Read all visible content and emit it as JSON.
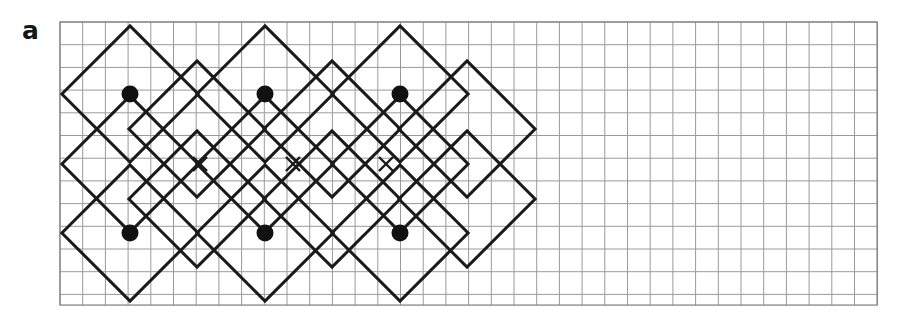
{
  "figure": {
    "panel_label": "a",
    "caption": "",
    "background_color": "#ffffff"
  },
  "colors": {
    "grid_line": "#9a9a9a",
    "grid_border": "#7d7d7d",
    "lattice_line": "#1a1a1a",
    "marker_dot": "#111111",
    "marker_cross": "#1a1a1a",
    "label_text": "#161616"
  },
  "grid": {
    "x0": 60,
    "y0": 22,
    "cell": 22.7,
    "cols": 36,
    "rows": 12.47,
    "line_width": 1,
    "border_width": 1.2
  },
  "lattice": {
    "line_width": 3,
    "half_diagonal_cells": 3,
    "diamonds": [
      {
        "cx": 130,
        "cy": 94
      },
      {
        "cx": 265,
        "cy": 94
      },
      {
        "cx": 400,
        "cy": 94
      },
      {
        "cx": 130,
        "cy": 164
      },
      {
        "cx": 265,
        "cy": 164
      },
      {
        "cx": 400,
        "cy": 164
      },
      {
        "cx": 130,
        "cy": 233
      },
      {
        "cx": 265,
        "cy": 233
      },
      {
        "cx": 400,
        "cy": 233
      },
      {
        "cx": 197,
        "cy": 129
      },
      {
        "cx": 332,
        "cy": 129
      },
      {
        "cx": 467,
        "cy": 129
      },
      {
        "cx": 197,
        "cy": 199
      },
      {
        "cx": 332,
        "cy": 199
      },
      {
        "cx": 467,
        "cy": 199
      }
    ]
  },
  "markers": {
    "dot_radius": 8.5,
    "cross_arm": 7,
    "cross_width": 2.4,
    "dots": [
      {
        "x": 130,
        "y": 94,
        "label": "filled-circle"
      },
      {
        "x": 265,
        "y": 94,
        "label": "filled-circle"
      },
      {
        "x": 400,
        "y": 94,
        "label": "filled-circle"
      },
      {
        "x": 130,
        "y": 233,
        "label": "filled-circle"
      },
      {
        "x": 265,
        "y": 233,
        "label": "filled-circle"
      },
      {
        "x": 400,
        "y": 233,
        "label": "filled-circle"
      }
    ],
    "crosses": [
      {
        "x": 200,
        "y": 164,
        "label": "cross-marker"
      },
      {
        "x": 293,
        "y": 164,
        "label": "cross-marker"
      },
      {
        "x": 386,
        "y": 164,
        "label": "cross-marker"
      }
    ]
  },
  "chart_data": {
    "type": "scatter",
    "title": "",
    "subtitle": "",
    "xlabel": "",
    "ylabel": "",
    "grid": true,
    "legend": "none",
    "units": "lattice cells",
    "xlim": [
      0,
      36
    ],
    "ylim": [
      0,
      12.5
    ],
    "series": [
      {
        "name": "filled circles",
        "marker": "filled-circle",
        "x": [
          3.08,
          9.03,
          14.98,
          3.08,
          9.03,
          14.98
        ],
        "y": [
          3.17,
          3.17,
          3.17,
          9.29,
          9.29,
          9.29
        ]
      },
      {
        "name": "crosses",
        "marker": "cross",
        "x": [
          6.17,
          10.26,
          14.36
        ],
        "y": [
          6.26,
          6.26,
          6.26
        ]
      },
      {
        "name": "diamond outline vertices",
        "marker": "polygon",
        "x": [
          0.09,
          3.08,
          6.17,
          9.03,
          12.12,
          14.98,
          21.01
        ],
        "y": [
          6.26,
          0.09,
          6.26,
          0.09,
          6.26,
          0.09,
          6.26
        ]
      }
    ]
  }
}
